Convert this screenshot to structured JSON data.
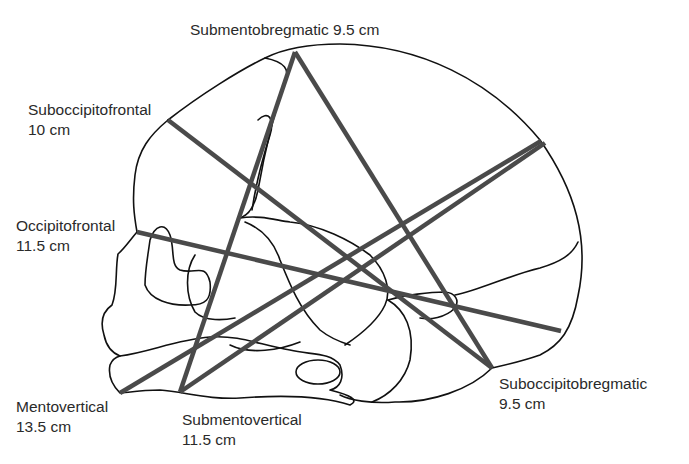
{
  "colors": {
    "outline": "#111111",
    "diameter_line": "#4a4a4a",
    "text": "#2a2a2a",
    "background": "#ffffff"
  },
  "labels": {
    "submentobregmatic": {
      "name": "Submentobregmatic",
      "value": "9.5 cm",
      "text": "Submentobregmatic 9.5 cm"
    },
    "suboccipitofrontal": {
      "name": "Suboccipitofrontal",
      "value": "10 cm"
    },
    "occipitofrontal": {
      "name": "Occipitofrontal",
      "value": "11.5 cm"
    },
    "mentovertical": {
      "name": "Mentovertical",
      "value": "13.5 cm"
    },
    "submentovertical": {
      "name": "Submentovertical",
      "value": "11.5 cm"
    },
    "suboccipitobregmatic": {
      "name": "Suboccipitobregmatic",
      "value": "9.5 cm"
    }
  },
  "diameters": [
    {
      "id": "submentobregmatic",
      "from": [
        180,
        392
      ],
      "to": [
        295,
        52
      ]
    },
    {
      "id": "suboccipitobregmatic",
      "from": [
        295,
        52
      ],
      "to": [
        492,
        368
      ]
    },
    {
      "id": "suboccipitofrontal",
      "from": [
        168,
        120
      ],
      "to": [
        492,
        368
      ]
    },
    {
      "id": "occipitofrontal",
      "from": [
        137,
        232
      ],
      "to": [
        561,
        331
      ]
    },
    {
      "id": "mentovertical",
      "from": [
        120,
        393
      ],
      "to": [
        541,
        141
      ]
    },
    {
      "id": "submentovertical",
      "from": [
        180,
        392
      ],
      "to": [
        545,
        143
      ]
    }
  ]
}
